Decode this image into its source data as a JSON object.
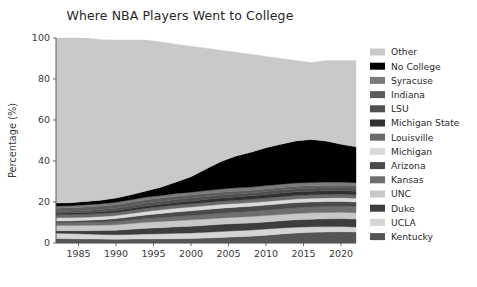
{
  "chart_data": {
    "type": "area",
    "stacked": true,
    "title": "Where NBA Players Went to College",
    "xlabel": "",
    "ylabel": "Percentage (%)",
    "xlim": [
      1982,
      2022
    ],
    "ylim": [
      0,
      100
    ],
    "xticks": [
      1985,
      1990,
      1995,
      2000,
      2005,
      2010,
      2015,
      2020
    ],
    "yticks": [
      0,
      20,
      40,
      60,
      80,
      100
    ],
    "grid": false,
    "legend_position": "right",
    "legend_order_top_to_bottom": [
      "Other",
      "No College",
      "Syracuse",
      "Indiana",
      "LSU",
      "Michigan State",
      "Louisville",
      "Michigan",
      "Arizona",
      "Kansas",
      "UNC",
      "Duke",
      "UCLA",
      "Kentucky"
    ],
    "x": [
      1982,
      1984,
      1986,
      1988,
      1990,
      1992,
      1994,
      1996,
      1998,
      2000,
      2002,
      2004,
      2006,
      2008,
      2010,
      2012,
      2014,
      2016,
      2018,
      2020,
      2022
    ],
    "series": [
      {
        "name": "Kentucky",
        "color": "#555555",
        "values": [
          2.2,
          2.1,
          2.0,
          1.9,
          1.8,
          1.9,
          2.0,
          2.0,
          2.1,
          2.2,
          2.4,
          2.7,
          3.0,
          3.3,
          3.8,
          4.4,
          4.9,
          5.2,
          5.4,
          5.5,
          5.4
        ]
      },
      {
        "name": "UCLA",
        "color": "#d6d6d6",
        "values": [
          2.6,
          2.5,
          2.4,
          2.3,
          2.2,
          2.3,
          2.4,
          2.5,
          2.6,
          2.7,
          2.8,
          2.9,
          3.0,
          3.0,
          3.0,
          2.9,
          2.8,
          2.7,
          2.6,
          2.5,
          2.4
        ]
      },
      {
        "name": "Duke",
        "color": "#3d3d3d",
        "values": [
          1.2,
          1.4,
          1.6,
          1.9,
          2.2,
          2.5,
          2.8,
          3.0,
          3.2,
          3.3,
          3.4,
          3.5,
          3.5,
          3.5,
          3.5,
          3.5,
          3.6,
          3.7,
          3.8,
          3.9,
          3.9
        ]
      },
      {
        "name": "UNC",
        "color": "#c8c8c8",
        "values": [
          2.5,
          2.5,
          2.6,
          2.6,
          2.7,
          2.8,
          2.9,
          3.0,
          3.0,
          3.1,
          3.1,
          3.1,
          3.1,
          3.1,
          3.1,
          3.1,
          3.1,
          3.1,
          3.1,
          3.1,
          3.0
        ]
      },
      {
        "name": "Kansas",
        "color": "#6e6e6e",
        "values": [
          1.4,
          1.4,
          1.5,
          1.5,
          1.6,
          1.7,
          1.8,
          1.9,
          2.0,
          2.1,
          2.2,
          2.3,
          2.4,
          2.5,
          2.6,
          2.7,
          2.8,
          2.9,
          2.9,
          3.0,
          3.0
        ]
      },
      {
        "name": "Arizona",
        "color": "#4a4a4a",
        "values": [
          0.8,
          0.9,
          1.0,
          1.2,
          1.4,
          1.6,
          1.8,
          2.0,
          2.2,
          2.3,
          2.4,
          2.5,
          2.5,
          2.5,
          2.5,
          2.5,
          2.5,
          2.4,
          2.4,
          2.3,
          2.3
        ]
      },
      {
        "name": "Michigan",
        "color": "#dadada",
        "values": [
          1.6,
          1.6,
          1.5,
          1.5,
          1.5,
          1.6,
          1.7,
          1.8,
          1.9,
          1.9,
          1.9,
          1.9,
          1.8,
          1.8,
          1.8,
          1.8,
          1.8,
          1.8,
          1.8,
          1.8,
          1.8
        ]
      },
      {
        "name": "Louisville",
        "color": "#6a6a6a",
        "values": [
          1.5,
          1.5,
          1.5,
          1.5,
          1.5,
          1.5,
          1.5,
          1.5,
          1.5,
          1.5,
          1.5,
          1.5,
          1.5,
          1.6,
          1.6,
          1.7,
          1.7,
          1.7,
          1.7,
          1.7,
          1.7
        ]
      },
      {
        "name": "Michigan State",
        "color": "#313131",
        "values": [
          0.7,
          0.7,
          0.8,
          0.8,
          0.9,
          1.0,
          1.1,
          1.2,
          1.3,
          1.4,
          1.5,
          1.6,
          1.7,
          1.7,
          1.8,
          1.8,
          1.8,
          1.8,
          1.8,
          1.8,
          1.8
        ]
      },
      {
        "name": "LSU",
        "color": "#4f4f4f",
        "values": [
          0.8,
          0.9,
          1.0,
          1.1,
          1.2,
          1.3,
          1.4,
          1.4,
          1.4,
          1.4,
          1.4,
          1.4,
          1.4,
          1.4,
          1.4,
          1.4,
          1.4,
          1.4,
          1.4,
          1.4,
          1.4
        ]
      },
      {
        "name": "Indiana",
        "color": "#5c5c5c",
        "values": [
          1.7,
          1.7,
          1.7,
          1.7,
          1.7,
          1.7,
          1.7,
          1.6,
          1.6,
          1.5,
          1.5,
          1.4,
          1.4,
          1.3,
          1.3,
          1.3,
          1.3,
          1.2,
          1.2,
          1.2,
          1.2
        ]
      },
      {
        "name": "Syracuse",
        "color": "#7a7a7a",
        "values": [
          1.0,
          1.0,
          1.1,
          1.1,
          1.2,
          1.2,
          1.3,
          1.3,
          1.4,
          1.4,
          1.5,
          1.5,
          1.6,
          1.6,
          1.6,
          1.6,
          1.6,
          1.6,
          1.6,
          1.5,
          1.5
        ]
      },
      {
        "name": "No College",
        "color": "#000000",
        "values": [
          1.5,
          1.4,
          1.6,
          1.8,
          2.0,
          2.4,
          3.0,
          4.0,
          5.5,
          7.5,
          10.5,
          13.5,
          15.5,
          17.0,
          18.5,
          19.5,
          20.5,
          21.0,
          20.0,
          18.5,
          17.5
        ]
      },
      {
        "name": "Other",
        "color": "#c9c9c9",
        "values": [
          80.5,
          80.4,
          79.7,
          78.2,
          77.1,
          75.5,
          73.6,
          70.8,
          67.3,
          63.7,
          58.9,
          54.2,
          50.6,
          47.8,
          44.5,
          41.8,
          39.2,
          37.5,
          39.3,
          40.8,
          42.1
        ]
      }
    ]
  },
  "axes": {
    "xtick_labels": [
      "1985",
      "1990",
      "1995",
      "2000",
      "2005",
      "2010",
      "2015",
      "2020"
    ],
    "ytick_labels": [
      "0",
      "20",
      "40",
      "60",
      "80",
      "100"
    ],
    "ylabel": "Percentage (%)"
  }
}
